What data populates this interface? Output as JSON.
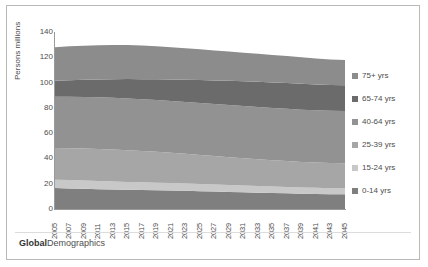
{
  "footer": {
    "brand_bold": "Global",
    "brand_light": "Demographics"
  },
  "chart_data": {
    "type": "area",
    "stacked": true,
    "title": "",
    "xlabel": "",
    "ylabel": "Persons millions",
    "ylim": [
      0,
      140
    ],
    "ytick_step": 20,
    "yticks": [
      "140",
      "120",
      "100",
      "80",
      "60",
      "40",
      "20",
      "0"
    ],
    "grid": false,
    "legend_position": "right",
    "x": [
      2005,
      2007,
      2009,
      2011,
      2013,
      2015,
      2017,
      2019,
      2021,
      2023,
      2025,
      2027,
      2029,
      2031,
      2033,
      2035,
      2037,
      2039,
      2041,
      2043,
      2045
    ],
    "xtick_labels": [
      "2005",
      "2007",
      "2009",
      "2011",
      "2013",
      "2015",
      "2017",
      "2019",
      "2021",
      "2023",
      "2025",
      "2027",
      "2029",
      "2031",
      "2033",
      "2035",
      "2037",
      "2039",
      "2041",
      "2043",
      "2045"
    ],
    "series": [
      {
        "name": "0-14 yrs",
        "color": "#7f7f7f",
        "values": [
          16.6,
          16.3,
          16.0,
          15.7,
          15.4,
          15.2,
          15.0,
          14.8,
          14.6,
          14.4,
          14.1,
          13.8,
          13.5,
          13.2,
          12.9,
          12.6,
          12.4,
          12.1,
          11.9,
          11.7,
          11.6
        ]
      },
      {
        "name": "15-24 yrs",
        "color": "#c8c8c8",
        "values": [
          6.6,
          6.6,
          6.5,
          6.4,
          6.3,
          6.2,
          6.1,
          6.0,
          5.9,
          5.8,
          5.7,
          5.6,
          5.5,
          5.4,
          5.3,
          5.2,
          5.1,
          5.0,
          4.9,
          4.8,
          4.8
        ]
      },
      {
        "name": "25-39 yrs",
        "color": "#a6a6a6",
        "values": [
          25.0,
          25.2,
          25.4,
          25.4,
          25.3,
          25.1,
          24.8,
          24.4,
          24.0,
          23.5,
          23.0,
          22.5,
          22.0,
          21.5,
          21.1,
          20.7,
          20.4,
          20.1,
          19.9,
          19.8,
          19.8
        ]
      },
      {
        "name": "40-64 yrs",
        "color": "#929292",
        "values": [
          40.5,
          40.6,
          40.7,
          40.8,
          40.9,
          41.0,
          41.0,
          41.0,
          41.0,
          41.0,
          41.1,
          41.2,
          41.3,
          41.4,
          41.4,
          41.4,
          41.4,
          41.4,
          41.4,
          41.4,
          41.4
        ]
      },
      {
        "name": "65-74 yrs",
        "color": "#6b6b6b",
        "values": [
          12.8,
          13.2,
          13.6,
          14.1,
          14.7,
          15.3,
          15.8,
          16.4,
          17.0,
          17.6,
          18.1,
          18.6,
          19.1,
          19.5,
          19.9,
          20.2,
          20.4,
          20.5,
          20.4,
          20.3,
          20.2
        ]
      },
      {
        "name": "75+ yrs",
        "color": "#8c8c8c",
        "values": [
          26.5,
          26.8,
          27.0,
          27.2,
          27.2,
          27.0,
          26.6,
          26.1,
          25.5,
          24.9,
          24.3,
          23.7,
          23.1,
          22.6,
          22.2,
          21.8,
          21.4,
          21.0,
          20.6,
          20.3,
          20.0
        ]
      }
    ]
  }
}
